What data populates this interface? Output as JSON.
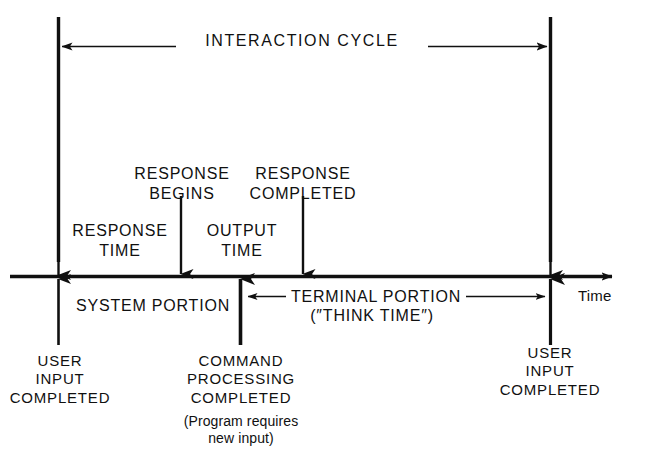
{
  "figure": {
    "type": "timing-diagram",
    "background_color": "#ffffff",
    "line_color": "#101010"
  },
  "spans": {
    "interaction_cycle": "INTERACTION CYCLE",
    "response_time": "RESPONSE\nTIME",
    "output_time": "OUTPUT\nTIME",
    "system_portion": "SYSTEM PORTION",
    "terminal_portion": "TERMINAL PORTION",
    "think_time": "(″THINK TIME″)"
  },
  "events": {
    "response_begins": "RESPONSE\nBEGINS",
    "response_completed": "RESPONSE\nCOMPLETED",
    "user_input_completed_left": "USER\nINPUT\nCOMPLETED",
    "command_processing_completed": "COMMAND\nPROCESSING\nCOMPLETED",
    "program_requires_new_input": "(Program requires\nnew input)",
    "user_input_completed_right": "USER\nINPUT\nCOMPLETED"
  },
  "axis": {
    "label": "Time",
    "direction": "left-to-right"
  },
  "markers": [
    {
      "name": "user-input-completed-left",
      "x": 58
    },
    {
      "name": "response-begins",
      "x": 181
    },
    {
      "name": "command-processing-completed",
      "x": 240
    },
    {
      "name": "response-completed",
      "x": 303
    },
    {
      "name": "user-input-completed-right",
      "x": 550
    }
  ]
}
